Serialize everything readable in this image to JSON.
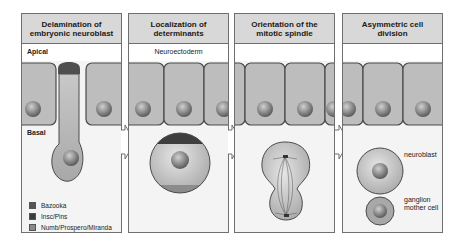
{
  "panels": [
    {
      "title": "Delamination of embryonic neuroblast",
      "band_label": "Apical",
      "side_label": "Basal"
    },
    {
      "title": "Localization of determinants",
      "band_label": "Neuroectoderm"
    },
    {
      "title": "Orientation of the mitotic spindle"
    },
    {
      "title": "Asymmetric cell division",
      "labels": {
        "neuroblast": "neuroblast",
        "gmc": "ganglion mother cell"
      }
    }
  ],
  "legend": [
    {
      "label": "Bazooka",
      "color": "#555555"
    },
    {
      "label": "Insc/Pins",
      "color": "#3c3c3c"
    },
    {
      "label": "Numb/Prospero/Miranda",
      "color": "#8a8a8a"
    }
  ],
  "colors": {
    "cell_fill": "#bdbdbd",
    "cell_border": "#4a4a4a",
    "panel_bg": "#f4f4f4",
    "header_bg": "#d8d8d8"
  }
}
